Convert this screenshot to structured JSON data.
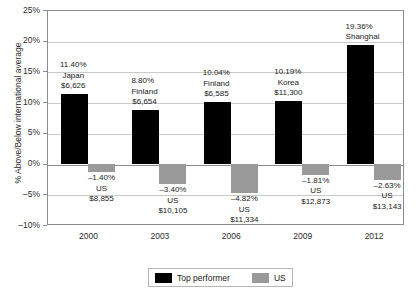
{
  "chart_data": {
    "type": "bar",
    "title": "",
    "xlabel": "",
    "ylabel": "% Above/Below international average",
    "ylim": [
      -10,
      25
    ],
    "ytick_labels": [
      "25%",
      "20%",
      "15%",
      "10%",
      "5%",
      "0%",
      "–5%",
      "–10%"
    ],
    "ytick_values": [
      25,
      20,
      15,
      10,
      5,
      0,
      -5,
      -10
    ],
    "categories": [
      "2000",
      "2003",
      "2006",
      "2009",
      "2012"
    ],
    "grid": true,
    "legend_position": "bottom",
    "series": [
      {
        "name": "Top performer",
        "color": "#000000",
        "values": [
          11.4,
          8.8,
          10.04,
          10.19,
          19.36
        ]
      },
      {
        "name": "US",
        "color": "#9a9a9a",
        "values": [
          -1.4,
          -3.4,
          -4.82,
          -1.81,
          -2.63
        ]
      }
    ],
    "annotations": {
      "top_performer": [
        {
          "pct": "11.40%",
          "country": "Japan",
          "amount": "$6,626"
        },
        {
          "pct": "8.80%",
          "country": "Finland",
          "amount": "$6,654"
        },
        {
          "pct": "10.04%",
          "country": "Finland",
          "amount": "$6,585"
        },
        {
          "pct": "10.19%",
          "country": "Korea",
          "amount": "$11,300"
        },
        {
          "pct": "19.36%",
          "country": "Shanghai",
          "amount": ""
        }
      ],
      "us": [
        {
          "pct": "–1.40%",
          "country": "US",
          "amount": "$8,855"
        },
        {
          "pct": "–3.40%",
          "country": "US",
          "amount": "$10,105"
        },
        {
          "pct": "–4.82%",
          "country": "US",
          "amount": "$11,334"
        },
        {
          "pct": "–1.81%",
          "country": "US",
          "amount": "$12,873"
        },
        {
          "pct": "–2.63%",
          "country": "US",
          "amount": "$13,143"
        }
      ]
    }
  },
  "legend": {
    "top_performer_label": "Top performer",
    "us_label": "US"
  }
}
